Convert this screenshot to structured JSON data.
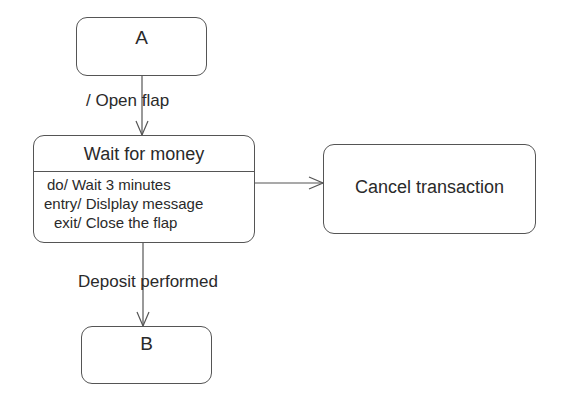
{
  "diagram": {
    "type": "uml-state-machine",
    "states": {
      "a": {
        "name": "A"
      },
      "wait": {
        "name": "Wait for money",
        "activities": [
          "do/ Wait 3 minutes",
          "entry/ Dislplay message",
          "exit/ Close the flap"
        ]
      },
      "cancel": {
        "name": "Cancel transaction"
      },
      "b": {
        "name": "B"
      }
    },
    "transitions": [
      {
        "from": "A",
        "to": "Wait for money",
        "label": "/ Open flap"
      },
      {
        "from": "Wait for money",
        "to": "Cancel transaction",
        "label": ""
      },
      {
        "from": "Wait for money",
        "to": "B",
        "label": "Deposit performed"
      }
    ]
  }
}
